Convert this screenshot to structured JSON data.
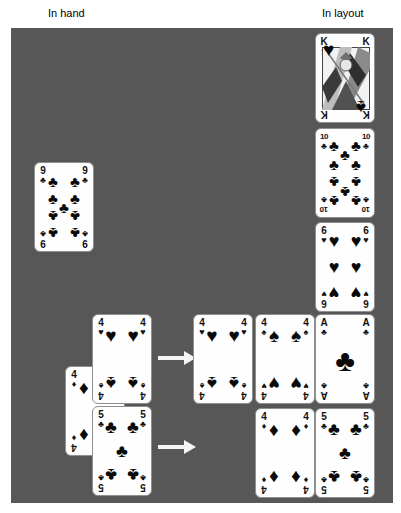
{
  "labels": {
    "in_hand": "In hand",
    "in_layout": "In layout"
  },
  "colors": {
    "board": "#575757",
    "card_face": "#fefefe",
    "card_border": "#8f8f8f",
    "pip": "#0a0a0a",
    "arrow": "#f5f5f5"
  },
  "suit_glyphs": {
    "hearts": "♥",
    "diamonds": "♦",
    "clubs": "♣",
    "spades": "♠"
  },
  "pip_layouts": {
    "p1": [
      [
        50,
        52,
        30,
        false
      ]
    ],
    "p4": [
      [
        31,
        23,
        19,
        false
      ],
      [
        69,
        23,
        19,
        false
      ],
      [
        31,
        77,
        19,
        true
      ],
      [
        69,
        77,
        19,
        true
      ]
    ],
    "p5": [
      [
        31,
        23,
        18,
        false
      ],
      [
        69,
        23,
        18,
        false
      ],
      [
        50,
        50,
        18,
        false
      ],
      [
        31,
        77,
        18,
        true
      ],
      [
        69,
        77,
        18,
        true
      ]
    ],
    "p6": [
      [
        31,
        21,
        18,
        false
      ],
      [
        69,
        21,
        18,
        false
      ],
      [
        31,
        50,
        18,
        false
      ],
      [
        69,
        50,
        18,
        false
      ],
      [
        31,
        79,
        18,
        true
      ],
      [
        69,
        79,
        18,
        true
      ]
    ],
    "p9": [
      [
        31,
        20,
        15,
        false
      ],
      [
        69,
        20,
        15,
        false
      ],
      [
        31,
        40,
        15,
        false
      ],
      [
        69,
        40,
        15,
        false
      ],
      [
        50,
        50,
        15,
        false
      ],
      [
        31,
        60,
        15,
        true
      ],
      [
        69,
        60,
        15,
        true
      ],
      [
        31,
        80,
        15,
        true
      ],
      [
        69,
        80,
        15,
        true
      ]
    ],
    "p10": [
      [
        31,
        18,
        15,
        false
      ],
      [
        69,
        18,
        15,
        false
      ],
      [
        50,
        28,
        15,
        false
      ],
      [
        31,
        40,
        15,
        false
      ],
      [
        69,
        40,
        15,
        false
      ],
      [
        31,
        60,
        15,
        true
      ],
      [
        69,
        60,
        15,
        true
      ],
      [
        50,
        72,
        15,
        true
      ],
      [
        31,
        82,
        15,
        true
      ],
      [
        69,
        82,
        15,
        true
      ]
    ],
    "face": [
      [
        22,
        17,
        19,
        false
      ],
      [
        78,
        83,
        19,
        true
      ]
    ]
  },
  "cards": [
    {
      "name": "card-9-clubs-hand",
      "zone": "hand",
      "rank": "9",
      "top_suit": "clubs",
      "bottom_suit": "clubs",
      "layout": "p9",
      "x": 34,
      "y": 162,
      "z": 1
    },
    {
      "name": "card-4-diamonds-hand",
      "zone": "hand",
      "rank": "4",
      "top_suit": "diamonds",
      "bottom_suit": "diamonds",
      "layout": "p4",
      "x": 65,
      "y": 366,
      "z": 1
    },
    {
      "name": "card-4-hearts-4-spades-hand",
      "zone": "hand",
      "rank": "4",
      "top_suit": "hearts",
      "bottom_suit": "spades",
      "layout": "p4",
      "x": 92,
      "y": 314,
      "z": 2
    },
    {
      "name": "card-5-clubs-hand",
      "zone": "hand",
      "rank": "5",
      "top_suit": "clubs",
      "bottom_suit": "clubs",
      "layout": "p5",
      "x": 92,
      "y": 406,
      "z": 2
    },
    {
      "name": "card-king-hearts-king-spades",
      "zone": "layout",
      "rank": "K",
      "top_suit": "hearts",
      "bottom_suit": "spades",
      "layout": "face",
      "x": 315,
      "y": 33,
      "z": 1
    },
    {
      "name": "card-10-clubs-layout",
      "zone": "layout",
      "rank": "10",
      "top_suit": "clubs",
      "bottom_suit": "clubs",
      "layout": "p10",
      "x": 315,
      "y": 128,
      "z": 1
    },
    {
      "name": "card-6-hearts-layout",
      "zone": "layout",
      "rank": "6",
      "top_suit": "hearts",
      "bottom_suit": "hearts",
      "layout": "p6",
      "x": 315,
      "y": 222,
      "z": 1
    },
    {
      "name": "card-4-hearts-4-spades-layout",
      "zone": "layout",
      "rank": "4",
      "top_suit": "hearts",
      "bottom_suit": "spades",
      "layout": "p4",
      "x": 193,
      "y": 314,
      "z": 1
    },
    {
      "name": "card-4-spades-4-hearts-layout",
      "zone": "layout",
      "rank": "4",
      "top_suit": "spades",
      "bottom_suit": "hearts",
      "layout": "p4",
      "x": 255,
      "y": 314,
      "z": 1
    },
    {
      "name": "card-ace-clubs-layout",
      "zone": "layout",
      "rank": "A",
      "top_suit": "clubs",
      "bottom_suit": "clubs",
      "layout": "p1",
      "x": 315,
      "y": 314,
      "z": 1
    },
    {
      "name": "card-4-diamonds-layout",
      "zone": "layout",
      "rank": "4",
      "top_suit": "diamonds",
      "bottom_suit": "diamonds",
      "layout": "p4",
      "x": 255,
      "y": 408,
      "z": 1
    },
    {
      "name": "card-5-clubs-layout",
      "zone": "layout",
      "rank": "5",
      "top_suit": "clubs",
      "bottom_suit": "clubs",
      "layout": "p5",
      "x": 315,
      "y": 408,
      "z": 1
    }
  ],
  "arrows": [
    {
      "name": "move-arrow-top",
      "x": 158,
      "y": 350
    },
    {
      "name": "move-arrow-bottom",
      "x": 158,
      "y": 439
    }
  ]
}
